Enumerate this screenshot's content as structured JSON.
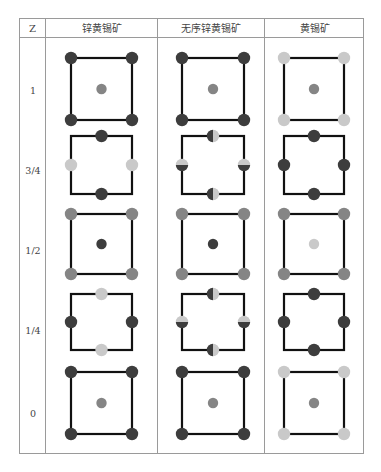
{
  "table": {
    "headers": [
      "Z",
      "锌黄锡矿",
      "无序锌黄锡矿",
      "黄锡矿"
    ],
    "rows": [
      {
        "z": "1"
      },
      {
        "z": "3/4"
      },
      {
        "z": "1/2"
      },
      {
        "z": "1/4"
      },
      {
        "z": "0"
      }
    ]
  },
  "colors": {
    "dark": "#3d3d3d",
    "medium": "#858585",
    "light": "#c9c9c9",
    "line": "#111111",
    "border": "#9a9a9a"
  },
  "diagram": {
    "cells": [
      [
        {
          "pattern": "corners+center",
          "corner": "dark",
          "center": "medium"
        },
        {
          "pattern": "corners+center",
          "corner": "dark",
          "center": "medium"
        },
        {
          "pattern": "corners+center",
          "corner": "light",
          "center": "medium"
        }
      ],
      [
        {
          "pattern": "edges",
          "top": "dark",
          "bottom": "dark",
          "left": "light",
          "right": "light"
        },
        {
          "pattern": "edges",
          "top": "half-v",
          "bottom": "half-v",
          "left": "half-h",
          "right": "half-h"
        },
        {
          "pattern": "edges",
          "top": "dark",
          "bottom": "dark",
          "left": "dark",
          "right": "dark"
        }
      ],
      [
        {
          "pattern": "corners+center",
          "corner": "medium",
          "center": "dark"
        },
        {
          "pattern": "corners+center",
          "corner": "medium",
          "center": "dark"
        },
        {
          "pattern": "corners+center",
          "corner": "medium",
          "center": "light"
        }
      ],
      [
        {
          "pattern": "edges",
          "top": "light",
          "bottom": "light",
          "left": "dark",
          "right": "dark"
        },
        {
          "pattern": "edges",
          "top": "half-v",
          "bottom": "half-v",
          "left": "half-h",
          "right": "half-h"
        },
        {
          "pattern": "edges",
          "top": "dark",
          "bottom": "dark",
          "left": "dark",
          "right": "dark"
        }
      ],
      [
        {
          "pattern": "corners+center",
          "corner": "dark",
          "center": "medium"
        },
        {
          "pattern": "corners+center",
          "corner": "dark",
          "center": "medium"
        },
        {
          "pattern": "corners+center",
          "corner": "light",
          "center": "medium"
        }
      ]
    ]
  }
}
